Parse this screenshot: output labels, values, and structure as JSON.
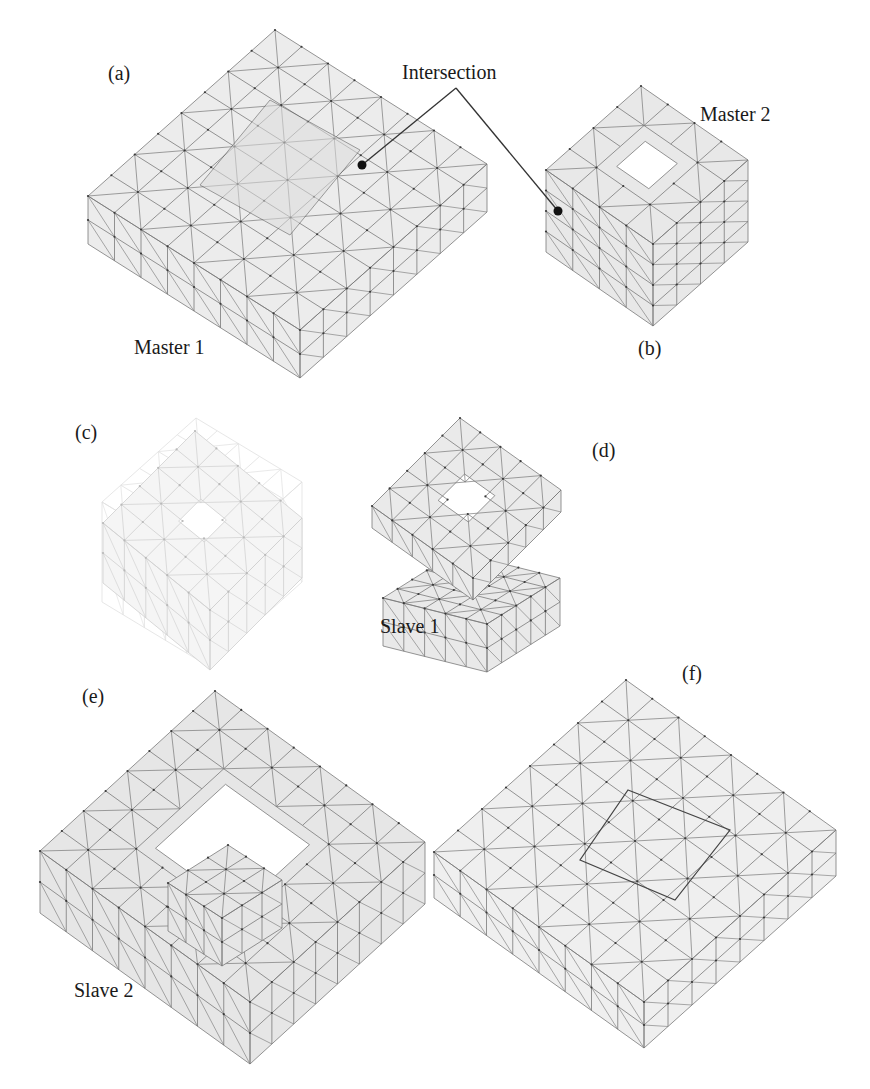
{
  "figure": {
    "panels": [
      {
        "id": "a",
        "tag": "(a)",
        "name": "Master 1"
      },
      {
        "id": "b",
        "tag": "(b)",
        "name": "Master 2"
      },
      {
        "id": "c",
        "tag": "(c)",
        "name": ""
      },
      {
        "id": "d",
        "tag": "(d)",
        "name": "Slave 1"
      },
      {
        "id": "e",
        "tag": "(e)",
        "name": "Slave 2"
      },
      {
        "id": "f",
        "tag": "(f)",
        "name": ""
      }
    ],
    "annotation": {
      "text": "Intersection"
    },
    "colors": {
      "mesh_line": "#7a7a7a",
      "mesh_fill": "#ececec",
      "mesh_fill_dark": "#e0e0e0",
      "node": "#3a3a3a",
      "text": "#1a1a1a",
      "leader": "#333333"
    }
  }
}
